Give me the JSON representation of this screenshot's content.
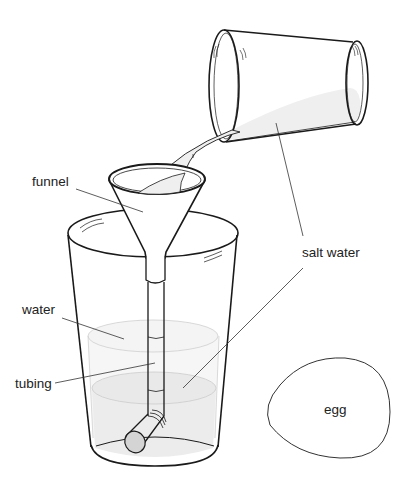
{
  "diagram": {
    "labels": {
      "funnel": "funnel",
      "salt_water": "salt water",
      "water": "water",
      "tubing": "tubing",
      "egg": "egg"
    },
    "colors": {
      "outline": "#1a1a1a",
      "leader": "#333333",
      "liquid": "#efefef",
      "water_tint": "#f4f4f4",
      "salt_water_tint": "#ebebeb",
      "tube_cap": "#d4d4d4"
    }
  }
}
